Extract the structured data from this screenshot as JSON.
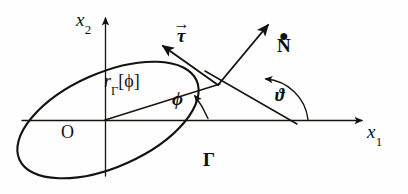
{
  "figure": {
    "caption_present": false,
    "axes": {
      "x_axis": {
        "label": "x",
        "subscript": "1",
        "name": "horizontal-axis"
      },
      "y_axis": {
        "label": "x",
        "subscript": "2",
        "name": "vertical-axis"
      },
      "origin_label": "O"
    },
    "curve": {
      "name": "closed-curve-gamma",
      "label": "Γ",
      "shape": "ellipse",
      "center_px": [
        108,
        120
      ],
      "semi_major_px": 97,
      "semi_minor_px": 47,
      "rotation_deg": -24
    },
    "radius": {
      "label_base": "r",
      "label_subscript": "Γ",
      "label_argument": "[ϕ]",
      "full_label": "rΓ[ϕ]",
      "from_px": [
        105,
        120
      ],
      "to_px": [
        218,
        85
      ]
    },
    "angles": [
      {
        "name": "phi-angle",
        "symbol": "ϕ",
        "between": "x1-axis and radius vector",
        "vertex_px": [
          105,
          120
        ]
      },
      {
        "name": "theta-angle",
        "symbol": "ϑ",
        "between": "x1-axis and normal line",
        "vertex_px": [
          291,
          120
        ]
      }
    ],
    "vectors": [
      {
        "name": "tangent-vector",
        "symbol": "τ",
        "accent": "arrow",
        "label": "⃗τ",
        "from_px": [
          218,
          85
        ],
        "to_px": [
          163,
          46
        ]
      },
      {
        "name": "n-dot-vector",
        "symbol": "N",
        "accent": "dot",
        "label": "Ṅ",
        "from_px": [
          218,
          85
        ],
        "to_px": [
          268,
          24
        ]
      }
    ],
    "colors": {
      "ink": "#121010",
      "background": "#ffffff"
    }
  }
}
